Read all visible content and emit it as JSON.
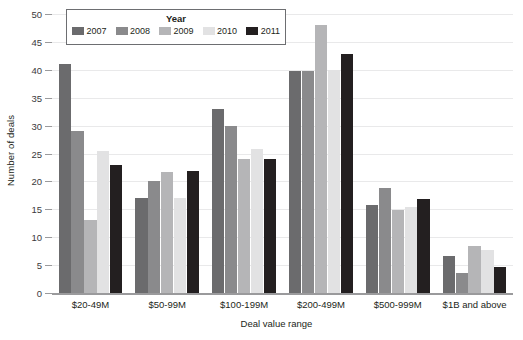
{
  "chart_data": {
    "type": "bar",
    "title": "",
    "xlabel": "Deal value range",
    "ylabel": "Number of deals",
    "ylim": [
      0,
      50
    ],
    "yticks": [
      0,
      5,
      10,
      15,
      20,
      25,
      30,
      35,
      40,
      45,
      50
    ],
    "grid": true,
    "legend_position": "top-left",
    "legend_title": "Year",
    "categories": [
      "$20-49M",
      "$50-99M",
      "$100-199M",
      "$200-499M",
      "$500-999M",
      "$1B and above"
    ],
    "series": [
      {
        "name": "2007",
        "color": "#6b6b6d",
        "values": [
          41,
          17,
          33,
          39.8,
          15.8,
          6.7
        ]
      },
      {
        "name": "2008",
        "color": "#8a8a8c",
        "values": [
          29,
          20,
          30,
          39.8,
          18.8,
          3.6
        ]
      },
      {
        "name": "2009",
        "color": "#b5b5b7",
        "values": [
          13,
          21.7,
          24,
          48,
          14.8,
          8.5
        ]
      },
      {
        "name": "2010",
        "color": "#e2e2e3",
        "values": [
          25.5,
          17,
          25.8,
          40,
          15.5,
          7.7
        ]
      },
      {
        "name": "2011",
        "color": "#231f20",
        "values": [
          23,
          21.8,
          24,
          42.8,
          16.8,
          4.6
        ]
      }
    ]
  }
}
